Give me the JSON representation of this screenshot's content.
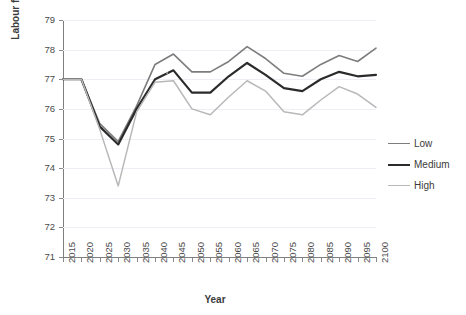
{
  "chart_data": {
    "type": "line",
    "title": "",
    "xlabel": "Year",
    "ylabel": "Labour force participation rate (%)",
    "xlim": [
      2015,
      2100
    ],
    "ylim": [
      71,
      79
    ],
    "ytick_step": 1,
    "grid": true,
    "legend_position": "right",
    "categories": [
      2015,
      2020,
      2025,
      2030,
      2035,
      2040,
      2045,
      2050,
      2055,
      2060,
      2065,
      2070,
      2075,
      2080,
      2085,
      2090,
      2095,
      2100
    ],
    "x_tick_labels": [
      "2015",
      "2020",
      "2025",
      "2030",
      "2035",
      "2040",
      "2045",
      "2050",
      "2055",
      "2060",
      "2065",
      "2070",
      "2075",
      "2080",
      "2085",
      "2090",
      "2095",
      "2100"
    ],
    "y_tick_labels": [
      "71",
      "72",
      "73",
      "74",
      "75",
      "76",
      "77",
      "78",
      "79"
    ],
    "series": [
      {
        "name": "Low",
        "color": "#7d7d7d",
        "width": 1.6,
        "values": [
          77.0,
          77.0,
          75.5,
          74.9,
          76.1,
          77.5,
          77.85,
          77.25,
          77.25,
          77.6,
          78.1,
          77.7,
          77.2,
          77.1,
          77.5,
          77.8,
          77.6,
          78.05
        ]
      },
      {
        "name": "Medium",
        "color": "#2b2b2b",
        "width": 2.2,
        "values": [
          77.0,
          77.0,
          75.4,
          74.8,
          76.0,
          77.0,
          77.3,
          76.55,
          76.55,
          77.1,
          77.55,
          77.15,
          76.7,
          76.6,
          77.0,
          77.25,
          77.1,
          77.15
        ]
      },
      {
        "name": "High",
        "color": "#b8b8b8",
        "width": 1.5,
        "values": [
          77.0,
          77.0,
          75.3,
          73.4,
          75.9,
          76.9,
          76.95,
          76.0,
          75.8,
          76.4,
          76.95,
          76.6,
          75.9,
          75.8,
          76.3,
          76.75,
          76.5,
          76.05
        ]
      }
    ]
  },
  "legend": {
    "items": [
      {
        "label": "Low"
      },
      {
        "label": "Medium"
      },
      {
        "label": "High"
      }
    ]
  }
}
